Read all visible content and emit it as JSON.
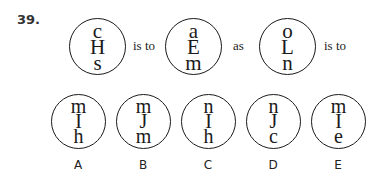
{
  "question": {
    "number": "39.",
    "analogy": [
      {
        "type": "circle",
        "letters": [
          "c",
          "H",
          "s"
        ]
      },
      {
        "type": "word",
        "text": "is to"
      },
      {
        "type": "circle",
        "letters": [
          "a",
          "E",
          "m"
        ]
      },
      {
        "type": "word",
        "text": "as"
      },
      {
        "type": "circle",
        "letters": [
          "o",
          "L",
          "n"
        ]
      },
      {
        "type": "word",
        "text": "is to"
      }
    ]
  },
  "options": [
    {
      "label": "A",
      "letters": [
        "m",
        "I",
        "h"
      ]
    },
    {
      "label": "B",
      "letters": [
        "m",
        "J",
        "m"
      ]
    },
    {
      "label": "C",
      "letters": [
        "n",
        "I",
        "h"
      ]
    },
    {
      "label": "D",
      "letters": [
        "n",
        "J",
        "c"
      ]
    },
    {
      "label": "E",
      "letters": [
        "m",
        "I",
        "e"
      ]
    }
  ]
}
